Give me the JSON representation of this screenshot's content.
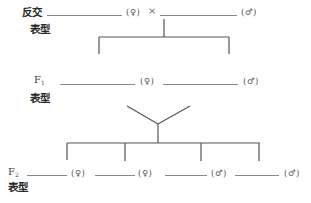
{
  "diagram": {
    "cross_label": "反交",
    "cross_sign": "×",
    "phenotype_label": "表型",
    "generations": {
      "parent": {
        "label": "",
        "blanks": [
          {
            "value": "",
            "sex": "(♀)"
          },
          {
            "value": "",
            "sex": "(♂)"
          }
        ]
      },
      "f1": {
        "label": "F",
        "subscript": "1",
        "blanks": [
          {
            "value": "",
            "sex": "(♀)"
          },
          {
            "value": "",
            "sex": "(♂)"
          }
        ]
      },
      "f2": {
        "label": "F",
        "subscript": "2",
        "blanks": [
          {
            "value": "",
            "sex": "(♀)"
          },
          {
            "value": "",
            "sex": "(♀)"
          },
          {
            "value": "",
            "sex": "(♂)"
          },
          {
            "value": "",
            "sex": "(♂)"
          }
        ]
      }
    },
    "colors": {
      "line": "#555555",
      "text": "#333333"
    }
  }
}
